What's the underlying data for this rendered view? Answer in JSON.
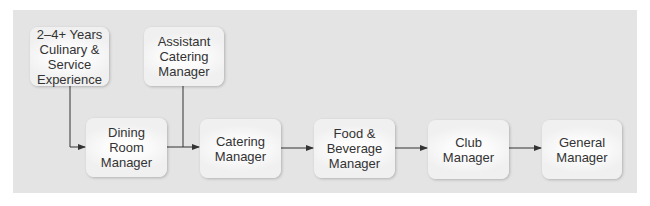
{
  "diagram": {
    "nodes": [
      {
        "id": "experience",
        "label": "2–4+ Years\nCulinary &\nService\nExperience"
      },
      {
        "id": "asst-catering",
        "label": "Assistant\nCatering\nManager"
      },
      {
        "id": "dining-room",
        "label": "Dining\nRoom\nManager"
      },
      {
        "id": "catering",
        "label": "Catering\nManager"
      },
      {
        "id": "food-bev",
        "label": "Food &\nBeverage\nManager"
      },
      {
        "id": "club",
        "label": "Club\nManager"
      },
      {
        "id": "general",
        "label": "General\nManager"
      }
    ],
    "edges": [
      {
        "from": "experience",
        "to": "dining-room"
      },
      {
        "from": "dining-room",
        "to": "catering"
      },
      {
        "from": "asst-catering",
        "to": "catering"
      },
      {
        "from": "catering",
        "to": "food-bev"
      },
      {
        "from": "food-bev",
        "to": "club"
      },
      {
        "from": "club",
        "to": "general"
      }
    ],
    "colors": {
      "panel": "#e4e4e4",
      "box": "#f4f4f4",
      "line": "#333333",
      "text": "#333333"
    }
  }
}
